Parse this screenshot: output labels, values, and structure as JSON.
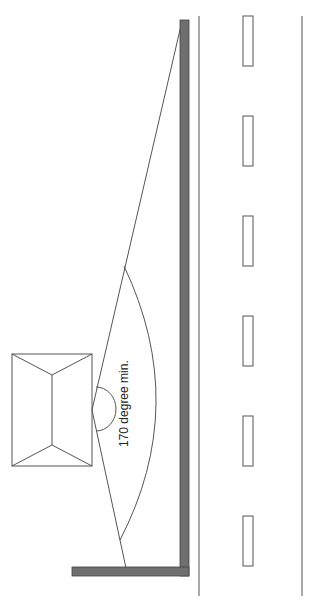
{
  "diagram": {
    "type": "sight-line-plan",
    "annotation": "170 degree min.",
    "elements": {
      "building": "house-roof-plan",
      "wall": "L-shaped boundary wall",
      "road": "road with dashed centre markings",
      "sight_cone": "visibility splay",
      "angle_arc": "angle indicator"
    },
    "colors": {
      "line": "#555555",
      "wall_fill": "#6f6f6f",
      "background": "#ffffff"
    },
    "lane_markers_count": 6
  }
}
